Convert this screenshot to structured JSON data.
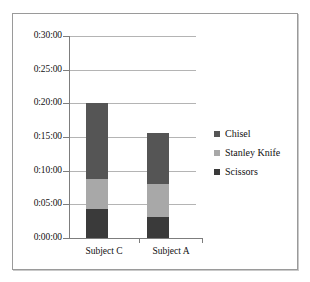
{
  "chart_data": {
    "type": "bar",
    "subtype": "stacked-bar",
    "title": "",
    "xlabel": "",
    "ylabel": "",
    "categories": [
      "Subject C",
      "Subject A"
    ],
    "ytick_labels": [
      "0:30:00",
      "0:25:00",
      "0:20:00",
      "0:15:00",
      "0:10:00",
      "0:05:00",
      "0:00:00"
    ],
    "ytick_values_minutes": [
      30,
      25,
      20,
      15,
      10,
      5,
      0
    ],
    "ylim_minutes": [
      0,
      30
    ],
    "grid": "horizontal",
    "legend_position": "right",
    "series": [
      {
        "name": "Chisel",
        "color": "#555555",
        "values_time": [
          "0:11:15",
          "0:07:40"
        ],
        "values_minutes": [
          11.25,
          7.67
        ]
      },
      {
        "name": "Stanley Knife",
        "color": "#a8a8a8",
        "values_time": [
          "0:04:25",
          "0:04:50"
        ],
        "values_minutes": [
          4.42,
          4.83
        ]
      },
      {
        "name": "Scissors",
        "color": "#3a3a3a",
        "values_time": [
          "0:04:20",
          "0:03:10"
        ],
        "values_minutes": [
          4.33,
          3.17
        ]
      }
    ],
    "totals_time": [
      "0:20:00",
      "0:15:40"
    ],
    "totals_minutes": [
      20.0,
      15.67
    ],
    "stack_order_bottom_to_top": [
      "Scissors",
      "Stanley Knife",
      "Chisel"
    ]
  },
  "legend": {
    "items": [
      {
        "label": "Chisel",
        "color": "#555555"
      },
      {
        "label": "Stanley Knife",
        "color": "#a8a8a8"
      },
      {
        "label": "Scissors",
        "color": "#3a3a3a"
      }
    ]
  },
  "axis": {
    "y_ticks": [
      {
        "label": "0:30:00"
      },
      {
        "label": "0:25:00"
      },
      {
        "label": "0:20:00"
      },
      {
        "label": "0:15:00"
      },
      {
        "label": "0:10:00"
      },
      {
        "label": "0:05:00"
      },
      {
        "label": "0:00:00"
      }
    ],
    "x_categories": [
      {
        "label": "Subject C"
      },
      {
        "label": "Subject A"
      }
    ]
  },
  "colors": {
    "frame_border": "#9a9a9a",
    "gridline": "#b4b4b4",
    "axis_line": "#7d7d7d",
    "background": "#ffffff",
    "text": "#111111"
  }
}
